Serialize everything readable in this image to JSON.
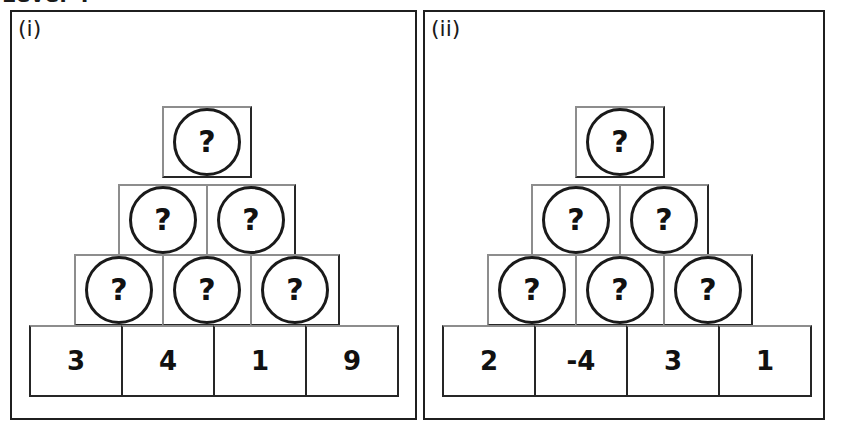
{
  "heading": {
    "text": "Level 4",
    "note": "clipped at top edge of scan"
  },
  "worksheet": {
    "type": "number-pyramid-puzzle",
    "unknown_symbol": "?",
    "panels": [
      {
        "label": "(i)",
        "rows": [
          {
            "cells": [
              "?"
            ]
          },
          {
            "cells": [
              "?",
              "?"
            ]
          },
          {
            "cells": [
              "?",
              "?",
              "?"
            ]
          },
          {
            "cells": [
              "3",
              "4",
              "1",
              "9"
            ]
          }
        ]
      },
      {
        "label": "(ii)",
        "rows": [
          {
            "cells": [
              "?"
            ]
          },
          {
            "cells": [
              "?",
              "?"
            ]
          },
          {
            "cells": [
              "?",
              "?",
              "?"
            ]
          },
          {
            "cells": [
              "2",
              "-4",
              "3",
              "1"
            ]
          }
        ]
      }
    ]
  },
  "colors": {
    "ink": "#111111",
    "border": "#262626",
    "panel_border": "#1f1f1f",
    "scan_grey": "#8d8d8d",
    "paper": "#ffffff"
  }
}
